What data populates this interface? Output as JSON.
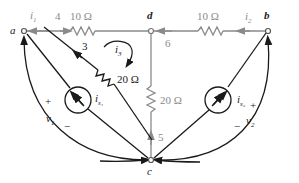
{
  "diagram": {
    "type": "circuit",
    "colors": {
      "gray_wire": "#8a8a8a",
      "black_wire": "#1a1a1a",
      "background": "#ffffff"
    },
    "nodes": {
      "a": "a",
      "b": "b",
      "c": "c",
      "d": "d"
    },
    "branches": {
      "b4": "4",
      "b6": "6",
      "b3": "3",
      "b5": "5"
    },
    "resistors": {
      "r_ad": "10 Ω",
      "r_db": "10 Ω",
      "r_ac": "20 Ω",
      "r_dc": "20 Ω"
    },
    "currents": {
      "i1": "i",
      "i1_sub": "1",
      "i2": "i",
      "i2_sub": "2",
      "i3": "i",
      "i3_sub": "3"
    },
    "sources": {
      "is1": "i",
      "is1_sub": "s₁",
      "is2": "i",
      "is2_sub": "s₂"
    },
    "voltages": {
      "v1": "v",
      "v1_sub": "1",
      "v1_plus": "+",
      "v1_minus": "−",
      "v2": "v",
      "v2_sub": "2",
      "v2_plus": "+",
      "v2_minus": "−"
    }
  }
}
